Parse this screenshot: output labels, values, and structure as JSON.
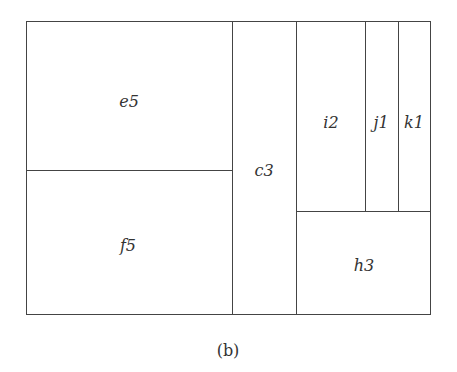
{
  "diagram": {
    "type": "treemap-partition",
    "cells": [
      {
        "id": "e5",
        "label": "e5",
        "x": 26,
        "y": 21,
        "w": 206,
        "h": 149
      },
      {
        "id": "f5",
        "label": "f5",
        "x": 26,
        "y": 170,
        "w": 206,
        "h": 144
      },
      {
        "id": "c3",
        "label": "c3",
        "x": 232,
        "y": 21,
        "w": 64,
        "h": 293
      },
      {
        "id": "i2",
        "label": "i2",
        "x": 296,
        "y": 21,
        "w": 69,
        "h": 190
      },
      {
        "id": "j1",
        "label": "j1",
        "x": 365,
        "y": 21,
        "w": 33,
        "h": 190
      },
      {
        "id": "k1",
        "label": "k1",
        "x": 398,
        "y": 21,
        "w": 32,
        "h": 190
      },
      {
        "id": "h3",
        "label": "h3",
        "x": 296,
        "y": 211,
        "w": 134,
        "h": 103
      }
    ],
    "caption": "(b)"
  }
}
